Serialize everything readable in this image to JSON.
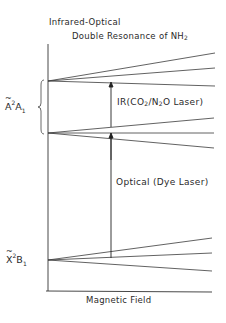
{
  "title": {
    "line1": "Infrared-Optical",
    "line2_prefix": "Double Resonance of NH",
    "line2_sub": "2"
  },
  "axes": {
    "x_label": "Magnetic Field",
    "y_axis_x": 48,
    "y_axis_top": 44,
    "x_axis_y": 291,
    "x_axis_left": 46,
    "x_axis_right": 212
  },
  "states": {
    "upper": {
      "letter": "A",
      "sup": "2",
      "main": "A",
      "sub": "1",
      "brace_top": 80,
      "brace_bottom": 134
    },
    "lower": {
      "letter": "X",
      "sup": "2",
      "main": "B",
      "sub": "1"
    }
  },
  "transitions": {
    "ir": {
      "prefix": "IR(CO",
      "sub1": "2",
      "mid": "/N",
      "sub2": "2",
      "suffix": "O Laser)",
      "x": 111,
      "y_from": 127,
      "y_to": 82
    },
    "optical": {
      "label": "Optical (Dye Laser)",
      "x": 111,
      "y_from": 258,
      "y_to": 133
    }
  },
  "chart_data": {
    "type": "energy-level-diagram",
    "xlabel": "Magnetic Field",
    "ylabel": "",
    "level_groups": [
      {
        "name": "A~2A1 upper rotational level",
        "origin": [
          48,
          81
        ],
        "branches_end": [
          [
            215,
            53
          ],
          [
            215,
            68
          ],
          [
            215,
            86
          ]
        ]
      },
      {
        "name": "A~2A1 lower rotational level",
        "origin": [
          48,
          133
        ],
        "branches_end": [
          [
            214,
            118
          ],
          [
            214,
            133
          ],
          [
            214,
            148
          ]
        ]
      },
      {
        "name": "X~2B1",
        "origin": [
          48,
          260
        ],
        "branches_end": [
          [
            212,
            238
          ],
          [
            212,
            253
          ],
          [
            212,
            271
          ]
        ]
      }
    ],
    "arrows": [
      {
        "name": "IR (CO2/N2O Laser)",
        "x": 111,
        "from_y": 127,
        "to_y": 82
      },
      {
        "name": "Optical (Dye Laser)",
        "x": 111,
        "from_y": 258,
        "to_y": 133
      }
    ]
  }
}
